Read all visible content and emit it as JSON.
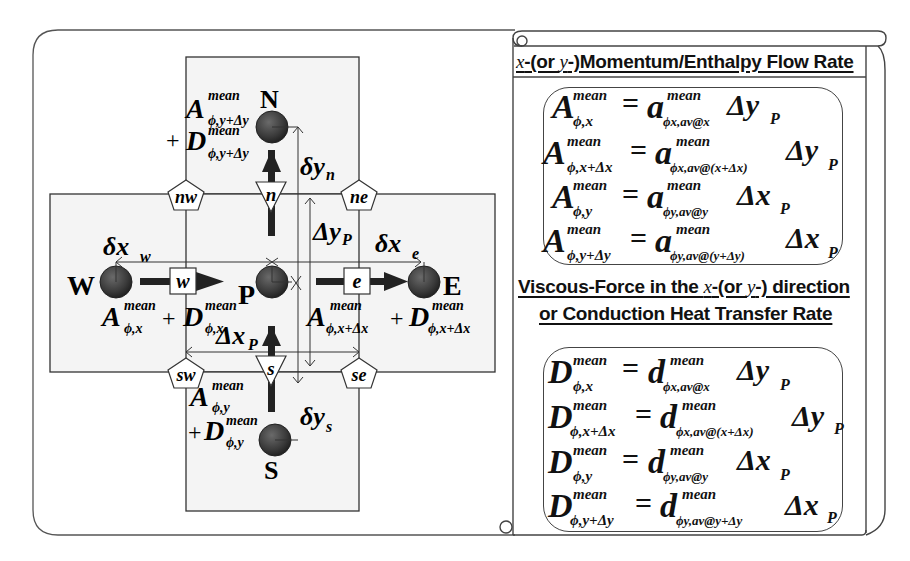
{
  "diagram": {
    "nodes": [
      {
        "id": "P",
        "label": "P"
      },
      {
        "id": "N",
        "label": "N"
      },
      {
        "id": "S",
        "label": "S"
      },
      {
        "id": "E",
        "label": "E"
      },
      {
        "id": "W",
        "label": "W"
      }
    ],
    "faces": [
      {
        "id": "n",
        "label": "n",
        "shape": "triangle"
      },
      {
        "id": "s",
        "label": "s",
        "shape": "triangle"
      },
      {
        "id": "e",
        "label": "e",
        "shape": "square"
      },
      {
        "id": "w",
        "label": "w",
        "shape": "square"
      }
    ],
    "corners": [
      {
        "id": "nw",
        "label": "nw",
        "shape": "pentagon"
      },
      {
        "id": "ne",
        "label": "ne",
        "shape": "pentagon"
      },
      {
        "id": "sw",
        "label": "sw",
        "shape": "pentagon"
      },
      {
        "id": "se",
        "label": "se",
        "shape": "pentagon"
      }
    ],
    "distances": {
      "dyn": {
        "base": "δy",
        "sub": "n"
      },
      "dys": {
        "base": "δy",
        "sub": "s"
      },
      "dxw": {
        "base": "δx",
        "sub": "w"
      },
      "dxe": {
        "base": "δx",
        "sub": "e"
      },
      "DyP": {
        "base": "Δy",
        "sub": "P"
      },
      "DxP": {
        "base": "Δx",
        "sub": "P"
      }
    },
    "flux_labels": {
      "north": {
        "A": "A",
        "A_sup": "mean",
        "A_sub": "ϕ,y+Δy",
        "plus": "+",
        "D": "D",
        "D_sup": "mean",
        "D_sub": "ϕ,y+Δy"
      },
      "south": {
        "A": "A",
        "A_sup": "mean",
        "A_sub": "ϕ,y",
        "plus": "+",
        "D": "D",
        "D_sup": "mean",
        "D_sub": "ϕ,y"
      },
      "west": {
        "A": "A",
        "A_sup": "mean",
        "A_sub": "ϕ,x",
        "plus": "+",
        "D": "D",
        "D_sup": "mean",
        "D_sub": "ϕ,x"
      },
      "east": {
        "A": "A",
        "A_sup": "mean",
        "A_sub": "ϕ,x+Δx",
        "plus": "+",
        "D": "D",
        "D_sup": "mean",
        "D_sub": "ϕ,x+Δx"
      }
    },
    "colors": {
      "node": "#3a3a3a",
      "cv_fill": "#f4f4f4",
      "line": "#333333"
    }
  },
  "panel": {
    "section1": {
      "title_pre": "x",
      "title_mid": "-(or ",
      "title_y": "y",
      "title_post": "-)Momentum/Enthalpy Flow Rate",
      "equations": [
        {
          "lhs": "A",
          "lhs_sup": "mean",
          "lhs_sub": "ϕ,x",
          "eq": "=",
          "rhs": "a",
          "rhs_sup": "mean",
          "rhs_sub": "ϕx,av@x",
          "mult": "Δy",
          "mult_sub": "P"
        },
        {
          "lhs": "A",
          "lhs_sup": "mean",
          "lhs_sub": "ϕ,x+Δx",
          "eq": "=",
          "rhs": "a",
          "rhs_sup": "mean",
          "rhs_sub": "ϕx,av@(x+Δx)",
          "mult": "Δy",
          "mult_sub": "P"
        },
        {
          "lhs": "A",
          "lhs_sup": "mean",
          "lhs_sub": "ϕ,y",
          "eq": "=",
          "rhs": "a",
          "rhs_sup": "mean",
          "rhs_sub": "ϕy,av@y",
          "mult": "Δx",
          "mult_sub": "P"
        },
        {
          "lhs": "A",
          "lhs_sup": "mean",
          "lhs_sub": "ϕ,y+Δy",
          "eq": "=",
          "rhs": "a",
          "rhs_sup": "mean",
          "rhs_sub": "ϕy,av@(y+Δy)",
          "mult": "Δx",
          "mult_sub": "P"
        }
      ]
    },
    "section2": {
      "title_line1_pre": "Viscous-Force in the ",
      "title_x": "x",
      "title_mid": "-(or ",
      "title_y": "y",
      "title_post": "-) direction",
      "title_line2": "or Conduction Heat Transfer Rate",
      "equations": [
        {
          "lhs": "D",
          "lhs_sup": "mean",
          "lhs_sub": "ϕ,x",
          "eq": "=",
          "rhs": "d",
          "rhs_sup": "mean",
          "rhs_sub": "ϕx,av@x",
          "mult": "Δy",
          "mult_sub": "P"
        },
        {
          "lhs": "D",
          "lhs_sup": "mean",
          "lhs_sub": "ϕ,x+Δx",
          "eq": "=",
          "rhs": "d",
          "rhs_sup": "mean",
          "rhs_sub": "ϕx,av@(x+Δx)",
          "mult": "Δy",
          "mult_sub": "P"
        },
        {
          "lhs": "D",
          "lhs_sup": "mean",
          "lhs_sub": "ϕ,y",
          "eq": "=",
          "rhs": "d",
          "rhs_sup": "mean",
          "rhs_sub": "ϕy,av@y",
          "mult": "Δx",
          "mult_sub": "P"
        },
        {
          "lhs": "D",
          "lhs_sup": "mean",
          "lhs_sub": "ϕ,y+Δy",
          "eq": "=",
          "rhs": "d",
          "rhs_sup": "mean",
          "rhs_sub": "ϕy,av@y+Δy",
          "mult": "Δx",
          "mult_sub": "P"
        }
      ]
    }
  }
}
